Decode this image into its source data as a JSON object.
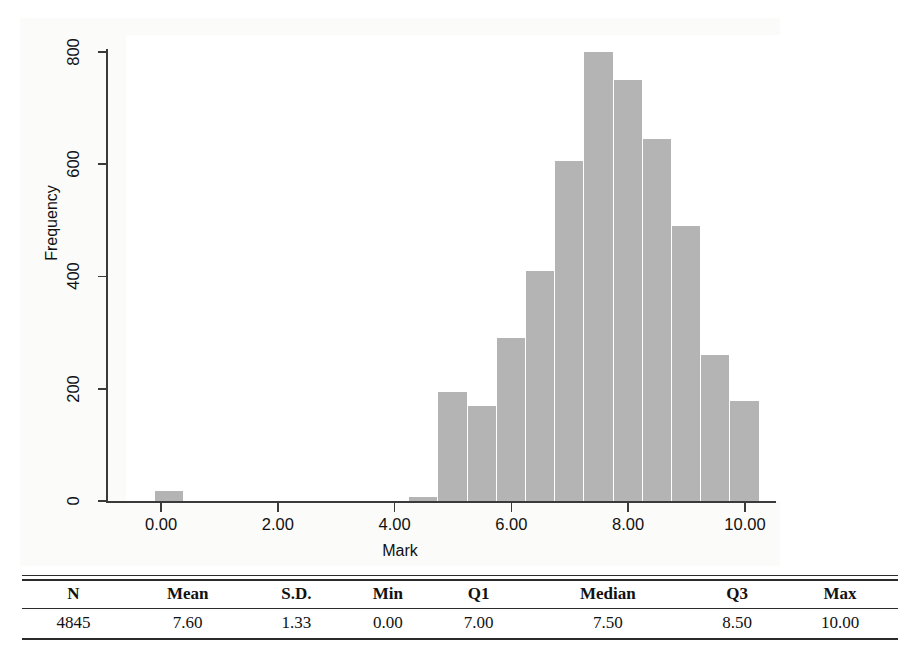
{
  "chart_data": {
    "type": "bar",
    "title": "",
    "xlabel": "Mark",
    "ylabel": "Frequency",
    "xlim": [
      -0.6,
      10.6
    ],
    "ylim": [
      0,
      830
    ],
    "xticks": [
      "0.00",
      "2.00",
      "4.00",
      "6.00",
      "8.00",
      "10.00"
    ],
    "xtick_values": [
      0,
      2,
      4,
      6,
      8,
      10
    ],
    "yticks": [
      "0",
      "200",
      "400",
      "600",
      "800"
    ],
    "ytick_values": [
      0,
      200,
      400,
      600,
      800
    ],
    "grid": false,
    "legend": "none",
    "bin_width": 0.5,
    "bar_color": "#b4b4b4",
    "bins": [
      {
        "x0": -0.1,
        "x1": 0.4,
        "value": 18
      },
      {
        "x0": 4.25,
        "x1": 4.75,
        "value": 8
      },
      {
        "x0": 4.75,
        "x1": 5.25,
        "value": 195
      },
      {
        "x0": 5.25,
        "x1": 5.75,
        "value": 170
      },
      {
        "x0": 5.75,
        "x1": 6.25,
        "value": 290
      },
      {
        "x0": 6.25,
        "x1": 6.75,
        "value": 410
      },
      {
        "x0": 6.75,
        "x1": 7.25,
        "value": 605
      },
      {
        "x0": 7.25,
        "x1": 7.75,
        "value": 800
      },
      {
        "x0": 7.75,
        "x1": 8.25,
        "value": 750
      },
      {
        "x0": 8.25,
        "x1": 8.75,
        "value": 645
      },
      {
        "x0": 8.75,
        "x1": 9.25,
        "value": 490
      },
      {
        "x0": 9.25,
        "x1": 9.75,
        "value": 260
      },
      {
        "x0": 9.75,
        "x1": 10.25,
        "value": 178
      }
    ],
    "categories": [
      "0.15",
      "4.50",
      "5.00",
      "5.50",
      "6.00",
      "6.50",
      "7.00",
      "7.50",
      "8.00",
      "8.50",
      "9.00",
      "9.50",
      "10.00"
    ],
    "values": [
      18,
      8,
      195,
      170,
      290,
      410,
      605,
      800,
      750,
      645,
      490,
      260,
      178
    ]
  },
  "stats_table": {
    "headers": [
      "N",
      "Mean",
      "S.D.",
      "Min",
      "Q1",
      "Median",
      "Q3",
      "Max"
    ],
    "row": [
      "4845",
      "7.60",
      "1.33",
      "0.00",
      "7.00",
      "7.50",
      "8.50",
      "10.00"
    ]
  }
}
